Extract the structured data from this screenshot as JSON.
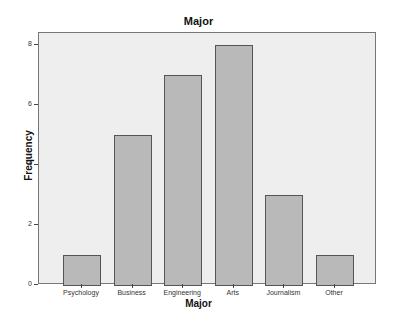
{
  "chart_data": {
    "type": "bar",
    "title": "Major",
    "xlabel": "Major",
    "ylabel": "Frequency",
    "categories": [
      "Psychology",
      "Business",
      "Engineering",
      "Arts",
      "Journalism",
      "Other"
    ],
    "values": [
      1,
      5,
      7,
      8,
      3,
      1
    ],
    "ylim": [
      0,
      8.4
    ],
    "yticks": [
      0,
      2,
      4,
      6,
      8
    ],
    "grid": false,
    "legend": null,
    "colors": {
      "bar_fill": "#b9b9b9",
      "bar_edge": "#555555",
      "plot_bg": "#eeeeee"
    }
  }
}
